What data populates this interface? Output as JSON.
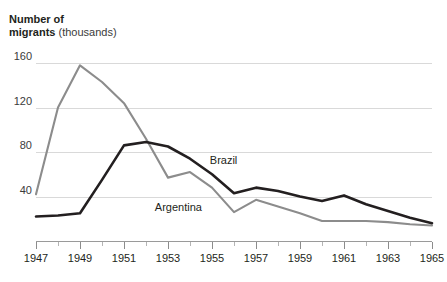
{
  "title": {
    "bold": "Number of migrants",
    "line1_bold": "Number of",
    "line2_bold": "migrants",
    "unit": "(thousands)"
  },
  "caption": "",
  "chart_data": {
    "type": "line",
    "title": "Number of migrants (thousands)",
    "xlabel": "",
    "ylabel": "Number of migrants (thousands)",
    "xlim": [
      1947,
      1965
    ],
    "ylim": [
      0,
      170
    ],
    "yticks": [
      40,
      80,
      120,
      160
    ],
    "ytick_labels": [
      "40",
      "80",
      "120",
      "160"
    ],
    "xticks": [
      1947,
      1949,
      1951,
      1953,
      1955,
      1957,
      1959,
      1961,
      1963,
      1965
    ],
    "xtick_labels": [
      "1947",
      "1949",
      "1951",
      "1953",
      "1955",
      "1957",
      "1959",
      "1961",
      "1963",
      "1965"
    ],
    "x_minor_step": 1,
    "grid": "horizontal",
    "legend": "inline-labels",
    "x": [
      1947,
      1948,
      1949,
      1950,
      1951,
      1952,
      1953,
      1954,
      1955,
      1956,
      1957,
      1958,
      1959,
      1960,
      1961,
      1962,
      1963,
      1964,
      1965
    ],
    "series": [
      {
        "name": "Argentina",
        "color": "#8c8c8c",
        "label_x": 1952.4,
        "label_y": 30,
        "values": [
          42,
          120,
          158,
          143,
          124,
          92,
          57,
          62,
          48,
          26,
          37,
          31,
          25,
          18,
          18,
          18,
          17,
          15,
          14
        ]
      },
      {
        "name": "Brazil",
        "color": "#231f20",
        "label_x": 1954.9,
        "label_y": 72,
        "values": [
          22,
          23,
          25,
          55,
          86,
          89,
          85,
          74,
          60,
          43,
          48,
          45,
          40,
          36,
          41,
          33,
          27,
          21,
          16
        ]
      }
    ]
  }
}
